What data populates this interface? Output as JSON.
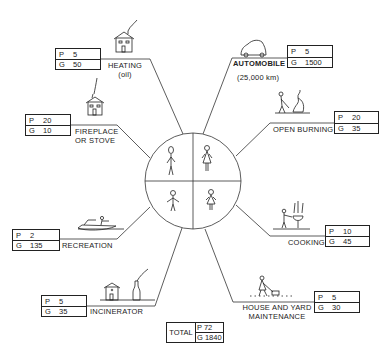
{
  "diagram": {
    "center": {
      "people": [
        "man",
        "woman",
        "boy",
        "girl"
      ]
    },
    "sources": [
      {
        "id": "heating",
        "label": "HEATING",
        "sublabel": "(oil)",
        "P": "5",
        "G": "50",
        "icon": "house-chimney-smoke-icon"
      },
      {
        "id": "fireplace",
        "label": "FIREPLACE",
        "sublabel": "OR STOVE",
        "P": "20",
        "G": "10",
        "icon": "house-chimney-smoke-icon"
      },
      {
        "id": "recreation",
        "label": "RECREATION",
        "sublabel": "",
        "P": "2",
        "G": "135",
        "icon": "motorboat-icon"
      },
      {
        "id": "incinerator",
        "label": "INCINERATOR",
        "sublabel": "",
        "P": "5",
        "G": "35",
        "icon": "incinerator-icon"
      },
      {
        "id": "automobile",
        "label": "AUTOMOBILE",
        "sublabel": "(25,000 km)",
        "P": "5",
        "G": "1500",
        "icon": "car-icon"
      },
      {
        "id": "open_burning",
        "label": "OPEN BURNING",
        "sublabel": "",
        "P": "20",
        "G": "35",
        "icon": "open-fire-icon"
      },
      {
        "id": "cooking",
        "label": "COOKING",
        "sublabel": "",
        "P": "10",
        "G": "45",
        "icon": "barbecue-icon"
      },
      {
        "id": "house_yard",
        "label": "HOUSE AND YARD",
        "sublabel": "MAINTENANCE",
        "P": "5",
        "G": "30",
        "icon": "lawnmower-icon"
      }
    ],
    "total": {
      "label": "TOTAL",
      "P": "P 72",
      "G": "G 1840"
    },
    "keys": {
      "P": "P",
      "G": "G"
    }
  }
}
